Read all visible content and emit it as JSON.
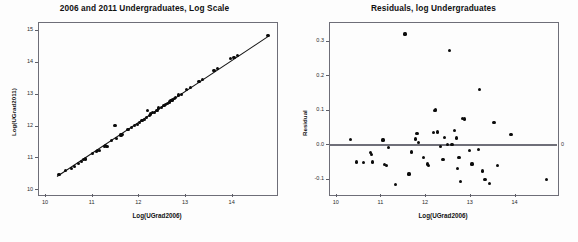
{
  "page": {
    "width": 578,
    "height": 242,
    "background": "#ffffff",
    "point_color": "#0b0b0b",
    "axis_color": "#6e6e78",
    "zeroline_color": "#6f6f79"
  },
  "chart_data": [
    {
      "id": "undergrad-scatter",
      "type": "scatter",
      "title": "2006 and 2011 Undergraduates, Log Scale",
      "xlabel": "Log(UGrad2006)",
      "ylabel": "Log(UGrad2011)",
      "xlim": [
        9.85,
        14.95
      ],
      "ylim": [
        9.85,
        15.25
      ],
      "xticks": [
        10,
        11,
        12,
        13,
        14
      ],
      "yticks": [
        10,
        11,
        12,
        13,
        14,
        15
      ],
      "xtick_labels": [
        "10",
        "11",
        "12",
        "13",
        "14"
      ],
      "ytick_labels": [
        "10",
        "11",
        "12",
        "13",
        "14",
        "15"
      ],
      "grid": false,
      "legend": "none",
      "fit_line": {
        "x0": 10.25,
        "y0": 10.42,
        "x1": 14.78,
        "y1": 14.82
      },
      "points": [
        [
          10.3,
          10.46
        ],
        [
          10.44,
          10.58
        ],
        [
          10.56,
          10.66
        ],
        [
          10.63,
          10.72
        ],
        [
          10.71,
          10.8
        ],
        [
          10.78,
          10.88
        ],
        [
          10.83,
          10.93
        ],
        [
          10.86,
          10.95
        ],
        [
          11.02,
          11.13
        ],
        [
          11.1,
          11.19
        ],
        [
          11.13,
          11.22
        ],
        [
          11.16,
          11.21
        ],
        [
          11.28,
          11.33
        ],
        [
          11.3,
          11.38
        ],
        [
          11.33,
          11.33
        ],
        [
          11.43,
          11.52
        ],
        [
          11.5,
          12.0
        ],
        [
          11.53,
          11.6
        ],
        [
          11.63,
          11.7
        ],
        [
          11.66,
          11.72
        ],
        [
          11.78,
          11.88
        ],
        [
          11.86,
          11.94
        ],
        [
          11.92,
          11.99
        ],
        [
          11.98,
          12.02
        ],
        [
          12.03,
          12.1
        ],
        [
          12.08,
          12.16
        ],
        [
          12.13,
          12.2
        ],
        [
          12.18,
          12.25
        ],
        [
          12.2,
          12.46
        ],
        [
          12.24,
          12.32
        ],
        [
          12.26,
          12.36
        ],
        [
          12.3,
          12.4
        ],
        [
          12.34,
          12.42
        ],
        [
          12.4,
          12.48
        ],
        [
          12.44,
          12.55
        ],
        [
          12.5,
          12.57
        ],
        [
          12.55,
          12.62
        ],
        [
          12.58,
          12.65
        ],
        [
          12.62,
          12.7
        ],
        [
          12.66,
          12.74
        ],
        [
          12.7,
          12.78
        ],
        [
          12.74,
          12.8
        ],
        [
          12.78,
          12.85
        ],
        [
          12.8,
          12.88
        ],
        [
          12.86,
          12.96
        ],
        [
          12.92,
          12.98
        ],
        [
          13.04,
          13.13
        ],
        [
          13.12,
          13.2
        ],
        [
          13.3,
          13.38
        ],
        [
          13.38,
          13.44
        ],
        [
          13.62,
          13.72
        ],
        [
          13.7,
          13.78
        ],
        [
          13.98,
          14.1
        ],
        [
          14.05,
          14.14
        ],
        [
          14.12,
          14.2
        ],
        [
          14.78,
          14.82
        ]
      ]
    },
    {
      "id": "residuals-scatter",
      "type": "scatter",
      "title": "Residuals, log Undergraduates",
      "xlabel": "Log(UGrad2006)",
      "ylabel": "Residual",
      "xlim": [
        9.85,
        14.95
      ],
      "ylim": [
        -0.145,
        0.355
      ],
      "xticks": [
        10,
        11,
        12,
        13,
        14
      ],
      "yticks": [
        -0.1,
        0.0,
        0.1,
        0.2,
        0.3
      ],
      "xtick_labels": [
        "10",
        "11",
        "12",
        "13",
        "14"
      ],
      "ytick_labels": [
        "-0.1",
        "0.0",
        "0.1",
        "0.2",
        "0.3"
      ],
      "grid": false,
      "legend": "none",
      "reference_line": {
        "y": 0.0,
        "right_label": "0"
      },
      "points": [
        [
          10.33,
          0.013
        ],
        [
          10.46,
          -0.052
        ],
        [
          10.62,
          -0.053
        ],
        [
          10.78,
          -0.024
        ],
        [
          10.8,
          -0.031
        ],
        [
          10.82,
          -0.052
        ],
        [
          11.06,
          0.012
        ],
        [
          11.1,
          -0.06
        ],
        [
          11.14,
          -0.062
        ],
        [
          11.18,
          -0.011
        ],
        [
          11.33,
          -0.118
        ],
        [
          11.55,
          0.32
        ],
        [
          11.64,
          -0.087
        ],
        [
          11.7,
          -0.023
        ],
        [
          11.79,
          0.015
        ],
        [
          11.82,
          0.031
        ],
        [
          11.86,
          0.004
        ],
        [
          11.96,
          -0.04
        ],
        [
          12.05,
          -0.058
        ],
        [
          12.08,
          -0.062
        ],
        [
          12.18,
          0.033
        ],
        [
          12.22,
          0.098
        ],
        [
          12.24,
          0.1
        ],
        [
          12.28,
          0.035
        ],
        [
          12.34,
          -0.006
        ],
        [
          12.4,
          -0.044
        ],
        [
          12.44,
          0.02
        ],
        [
          12.5,
          0.0
        ],
        [
          12.55,
          0.272
        ],
        [
          12.6,
          -0.002
        ],
        [
          12.66,
          0.04
        ],
        [
          12.7,
          0.018
        ],
        [
          12.72,
          -0.07
        ],
        [
          12.76,
          -0.038
        ],
        [
          12.8,
          -0.108
        ],
        [
          12.84,
          0.075
        ],
        [
          12.88,
          0.073
        ],
        [
          13.0,
          -0.018
        ],
        [
          13.05,
          -0.058
        ],
        [
          13.2,
          -0.015
        ],
        [
          13.22,
          0.158
        ],
        [
          13.28,
          -0.078
        ],
        [
          13.34,
          -0.102
        ],
        [
          13.44,
          -0.115
        ],
        [
          13.54,
          0.064
        ],
        [
          13.62,
          -0.062
        ],
        [
          13.92,
          0.028
        ],
        [
          14.72,
          -0.103
        ]
      ]
    }
  ]
}
